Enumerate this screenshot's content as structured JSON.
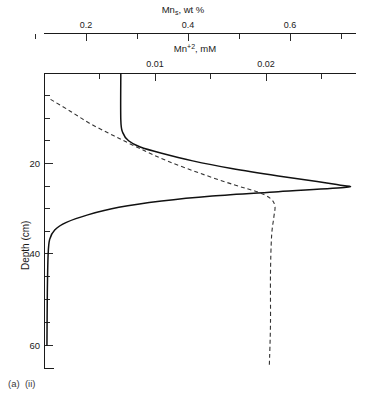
{
  "figure": {
    "caption": "(a)  (ii)",
    "caption_parts": {
      "panel": "(a)",
      "sub_panel": "(ii)"
    }
  },
  "chart_data": {
    "type": "line",
    "title": "",
    "orientation": "vertical-depth-profile",
    "ylabel": "Depth (cm)",
    "ylim": [
      15,
      62
    ],
    "y_ticks_major": [
      20,
      40,
      60
    ],
    "y_ticks_minor": [
      15,
      25,
      30,
      35,
      45,
      50,
      55
    ],
    "y_axis_inverted": true,
    "grid": false,
    "legend": null,
    "axes": [
      {
        "id": "top-axis-solid",
        "label": "Mn_s, wt %",
        "label_text": "Mn",
        "label_subscript": "s",
        "label_units": ", wt %",
        "position": "top",
        "xlim": [
          0.0,
          0.8
        ],
        "tick_labels": [
          "0.2",
          "0.4",
          "0.6"
        ],
        "tick_values": [
          0.2,
          0.4,
          0.6
        ],
        "minor_tick_values": [
          0.1,
          0.3,
          0.5,
          0.7
        ]
      },
      {
        "id": "second-axis-dashed",
        "label": "Mn+2, mM",
        "label_text": "Mn",
        "label_superscript": "+2",
        "label_units": ", mM",
        "position": "top-inner",
        "xlim": [
          0.0,
          0.028
        ],
        "tick_labels": [
          "0.01",
          "0.02"
        ],
        "tick_values": [
          0.01,
          0.02
        ],
        "minor_tick_values": [
          0.005,
          0.015,
          0.025
        ]
      }
    ],
    "series": [
      {
        "name": "Mn_s solid-phase",
        "style": "solid",
        "color": "#111111",
        "axis": "top-axis-solid",
        "description": "Near-zero at shallow depth, sharp peak near 33 cm, returns to near-zero below 40 cm",
        "points": [
          {
            "x": 0.195,
            "depth": 15.0
          },
          {
            "x": 0.195,
            "depth": 22.5
          },
          {
            "x": 0.2,
            "depth": 24.5
          },
          {
            "x": 0.215,
            "depth": 25.8
          },
          {
            "x": 0.245,
            "depth": 26.8
          },
          {
            "x": 0.3,
            "depth": 27.8
          },
          {
            "x": 0.38,
            "depth": 29.0
          },
          {
            "x": 0.48,
            "depth": 30.2
          },
          {
            "x": 0.6,
            "depth": 31.4
          },
          {
            "x": 0.7,
            "depth": 32.3
          },
          {
            "x": 0.76,
            "depth": 32.9
          },
          {
            "x": 0.775,
            "depth": 33.2
          },
          {
            "x": 0.6,
            "depth": 33.9
          },
          {
            "x": 0.43,
            "depth": 34.6
          },
          {
            "x": 0.3,
            "depth": 35.4
          },
          {
            "x": 0.19,
            "depth": 36.4
          },
          {
            "x": 0.11,
            "depth": 37.6
          },
          {
            "x": 0.055,
            "depth": 38.8
          },
          {
            "x": 0.025,
            "depth": 40.0
          },
          {
            "x": 0.012,
            "depth": 41.5
          },
          {
            "x": 0.008,
            "depth": 44.0
          },
          {
            "x": 0.006,
            "depth": 50.0
          },
          {
            "x": 0.005,
            "depth": 58.5
          }
        ]
      },
      {
        "name": "Mn+2 porewater",
        "style": "dashed",
        "color": "#333333",
        "axis": "second-axis-dashed",
        "description": "Rises steadily from 19 cm, broad maximum near 34 cm at ~0.0205 mM, constant to 61 cm",
        "points": [
          {
            "x": 0.0005,
            "depth": 19.2
          },
          {
            "x": 0.0022,
            "depth": 21.0
          },
          {
            "x": 0.004,
            "depth": 23.0
          },
          {
            "x": 0.0062,
            "depth": 25.0
          },
          {
            "x": 0.0085,
            "depth": 27.0
          },
          {
            "x": 0.011,
            "depth": 29.0
          },
          {
            "x": 0.014,
            "depth": 31.0
          },
          {
            "x": 0.017,
            "depth": 32.8
          },
          {
            "x": 0.0192,
            "depth": 34.0
          },
          {
            "x": 0.0203,
            "depth": 35.0
          },
          {
            "x": 0.0207,
            "depth": 36.2
          },
          {
            "x": 0.0206,
            "depth": 38.0
          },
          {
            "x": 0.0204,
            "depth": 41.0
          },
          {
            "x": 0.0203,
            "depth": 47.0
          },
          {
            "x": 0.0203,
            "depth": 55.0
          },
          {
            "x": 0.0202,
            "depth": 61.5
          }
        ]
      }
    ]
  }
}
